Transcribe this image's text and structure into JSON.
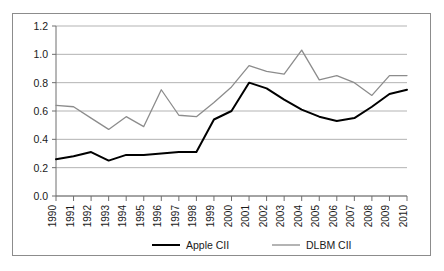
{
  "chart_data": {
    "type": "line",
    "title": "",
    "subtitle": "",
    "xlabel": "",
    "ylabel": "",
    "x": [
      1990,
      1991,
      1992,
      1993,
      1994,
      1995,
      1996,
      1997,
      1998,
      1999,
      2000,
      2001,
      2002,
      2003,
      2004,
      2005,
      2006,
      2007,
      2008,
      2009,
      2010
    ],
    "categories": [
      "1990",
      "1991",
      "1992",
      "1993",
      "1994",
      "1995",
      "1996",
      "1997",
      "1998",
      "1999",
      "2000",
      "2001",
      "2002",
      "2003",
      "2004",
      "2005",
      "2006",
      "2007",
      "2008",
      "2009",
      "2010"
    ],
    "series": [
      {
        "name": "Apple CII",
        "color": "#000000",
        "width": 2.0,
        "values": [
          0.26,
          0.28,
          0.31,
          0.25,
          0.29,
          0.29,
          0.3,
          0.31,
          0.31,
          0.54,
          0.6,
          0.8,
          0.76,
          0.68,
          0.61,
          0.56,
          0.53,
          0.55,
          0.63,
          0.72,
          0.75
        ]
      },
      {
        "name": "DLBM CII",
        "color": "#8c8c8c",
        "width": 1.3,
        "values": [
          0.64,
          0.63,
          0.55,
          0.47,
          0.56,
          0.49,
          0.75,
          0.57,
          0.56,
          0.66,
          0.77,
          0.92,
          0.88,
          0.86,
          1.03,
          0.82,
          0.85,
          0.8,
          0.71,
          0.85,
          0.85
        ]
      }
    ],
    "ylim": [
      0.0,
      1.2
    ],
    "ytick_values": [
      0.0,
      0.2,
      0.4,
      0.6,
      0.8,
      1.0,
      1.2
    ],
    "ytick_labels": [
      "0.0",
      "0.2",
      "0.4",
      "0.6",
      "0.8",
      "1.0",
      "1.2"
    ],
    "grid": "horizontal",
    "legend_position": "bottom",
    "legend": [
      {
        "label": "Apple CII",
        "color": "#000000",
        "width": 2.0
      },
      {
        "label": "DLBM CII",
        "color": "#8c8c8c",
        "width": 1.3
      }
    ]
  },
  "frame": {
    "border_color": "#8c8c8c",
    "background": "#ffffff"
  }
}
